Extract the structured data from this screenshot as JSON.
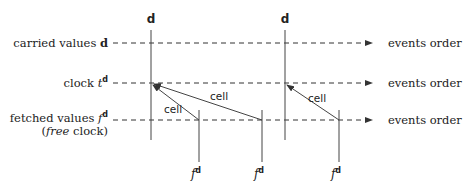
{
  "diagram": {
    "rows": [
      {
        "id": "carried",
        "label": "carried values ",
        "label_sym": "d",
        "y": 43,
        "right_label": "events order"
      },
      {
        "id": "clock",
        "label": "clock ",
        "label_sym": "t",
        "label_sup": "d",
        "y": 83,
        "right_label": "events order"
      },
      {
        "id": "fetched",
        "label": "fetched values ",
        "label_sym": "f",
        "label_sup": "d",
        "sub_label_italic": "free",
        "sub_label_rest": " clock)",
        "sub_label_open": "(",
        "y": 120,
        "right_label": "events order"
      }
    ],
    "columns": [
      {
        "id": "d1",
        "top_label": "d",
        "x": 151
      },
      {
        "id": "d2",
        "top_label": "d",
        "x": 285
      }
    ],
    "fetches": [
      {
        "id": "f1",
        "x": 199,
        "label": "f",
        "sup": "d"
      },
      {
        "id": "f2",
        "x": 262,
        "label": "f",
        "sup": "d"
      },
      {
        "id": "f3",
        "x": 339,
        "label": "f",
        "sup": "d"
      }
    ],
    "edges": [
      {
        "from": "f1",
        "to": "d1",
        "label": "cell"
      },
      {
        "from": "f2",
        "to": "d1",
        "label": "cell"
      },
      {
        "from": "f3",
        "to": "d2",
        "label": "cell"
      }
    ]
  }
}
